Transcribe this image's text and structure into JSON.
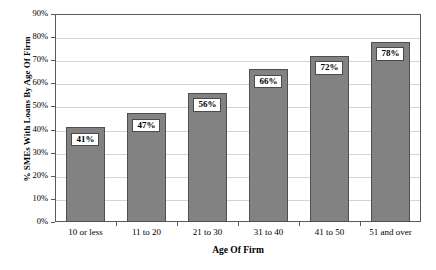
{
  "chart_data": {
    "type": "bar",
    "title": "",
    "categories": [
      "10 or less",
      "11 to 20",
      "21 to 30",
      "31 to 40",
      "41 to 50",
      "51 and over"
    ],
    "values": [
      41,
      47,
      56,
      66,
      72,
      78
    ],
    "data_labels": [
      "41%",
      "47%",
      "56%",
      "66%",
      "72%",
      "78%"
    ],
    "xlabel": "Age Of Firm",
    "ylabel": "% SMEs With Loans By Age Of Firm",
    "ylim": [
      0,
      90
    ],
    "ytick_labels": [
      "0%",
      "10%",
      "20%",
      "30%",
      "40%",
      "50%",
      "60%",
      "70%",
      "80%",
      "90%"
    ],
    "ytick_values": [
      0,
      10,
      20,
      30,
      40,
      50,
      60,
      70,
      80,
      90
    ],
    "grid": true,
    "legend": false,
    "series_name": "% SMEs With Loans",
    "bar_color": "#828282",
    "bar_border_color": "#4f4f4f",
    "gridline_color": "#d4d4d4",
    "frame_color": "#5a5a5a",
    "label_box_bg": "#ffffff",
    "label_box_border": "#4a4a4a"
  }
}
